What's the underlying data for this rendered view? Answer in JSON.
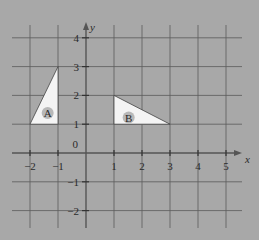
{
  "diagram": {
    "type": "coordinate-grid",
    "background_color": "#a8a8a8",
    "grid_color": "#5a5a5a",
    "axis_color": "#555555",
    "shape_fill": "#f4f4f4",
    "shape_stroke": "#444444",
    "x_axis": {
      "label": "x",
      "ticks": [
        "−2",
        "−1",
        "1",
        "2",
        "3",
        "4",
        "5"
      ],
      "tick_values": [
        -2,
        -1,
        1,
        2,
        3,
        4,
        5
      ],
      "range": [
        -2.6,
        5.6
      ]
    },
    "y_axis": {
      "label": "y",
      "ticks": [
        "4",
        "3",
        "2",
        "1",
        "−1",
        "−2"
      ],
      "tick_values": [
        4,
        3,
        2,
        1,
        -1,
        -2
      ],
      "range": [
        -2.6,
        4.4
      ]
    },
    "origin_label": "0",
    "shapes": [
      {
        "label": "A",
        "vertices": [
          [
            -2,
            1
          ],
          [
            -1,
            1
          ],
          [
            -1,
            3
          ]
        ]
      },
      {
        "label": "B",
        "vertices": [
          [
            1,
            2
          ],
          [
            1,
            1
          ],
          [
            3,
            1
          ]
        ]
      }
    ]
  }
}
